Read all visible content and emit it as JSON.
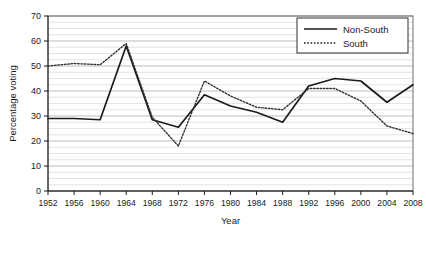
{
  "chart_data": {
    "type": "line",
    "title": "",
    "xlabel": "Year",
    "ylabel": "Percentage voting",
    "xlim": [
      1952,
      2008
    ],
    "ylim": [
      0,
      70
    ],
    "ytick_step": 10,
    "minor_grid": true,
    "minor_grid_step": 2.5,
    "grid": true,
    "legend_position": "top-right",
    "categories": [
      1952,
      1956,
      1960,
      1964,
      1968,
      1972,
      1976,
      1980,
      1984,
      1988,
      1992,
      1996,
      2000,
      2004,
      2008
    ],
    "xticklabels": [
      "1952",
      "1956",
      "1960",
      "1964",
      "1968",
      "1972",
      "1976",
      "1980",
      "1984",
      "1988",
      "1992",
      "1996",
      "2000",
      "2004",
      "2008"
    ],
    "yticklabels": [
      "0",
      "10",
      "20",
      "30",
      "40",
      "50",
      "60",
      "70"
    ],
    "series": [
      {
        "name": "Non-South",
        "style": "solid",
        "color": "#1a1a1a",
        "values": [
          29,
          29,
          28.5,
          58,
          28.5,
          25.5,
          38.5,
          34,
          31.5,
          27.5,
          42,
          45,
          44,
          35.5,
          42.5
        ]
      },
      {
        "name": "South",
        "style": "dotted",
        "color": "#333333",
        "values": [
          50,
          51,
          50.5,
          59,
          29.5,
          18,
          44,
          38,
          33.5,
          32.5,
          41,
          41,
          36,
          26,
          23
        ]
      }
    ]
  },
  "legend": {
    "items": [
      {
        "label": "Non-South",
        "style": "solid"
      },
      {
        "label": "South",
        "style": "dotted"
      }
    ]
  },
  "axes": {
    "x_title": "Year",
    "y_title": "Percentage voting"
  }
}
